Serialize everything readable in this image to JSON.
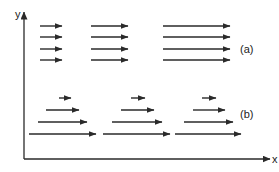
{
  "colors": {
    "stroke": "#2a2a2a",
    "background": "#ffffff",
    "text": "#222222"
  },
  "axes": {
    "x_label": "x",
    "y_label": "y",
    "origin": [
      24,
      159
    ],
    "x_end": 270,
    "y_end": 12
  },
  "groups": {
    "a": {
      "label": "(a)",
      "label_pos": [
        240,
        53
      ],
      "description": "uniform flow: equal-length arrows in every row",
      "arrows": [
        [
          40,
          62,
          26
        ],
        [
          91,
          128,
          26
        ],
        [
          163,
          230,
          26
        ],
        [
          40,
          62,
          37
        ],
        [
          91,
          128,
          37
        ],
        [
          163,
          230,
          37
        ],
        [
          40,
          62,
          49
        ],
        [
          91,
          128,
          49
        ],
        [
          163,
          230,
          49
        ],
        [
          40,
          62,
          60
        ],
        [
          91,
          128,
          60
        ],
        [
          163,
          230,
          60
        ]
      ]
    },
    "b": {
      "label": "(b)",
      "label_pos": [
        240,
        118
      ],
      "description": "shear flow: arrow length increases downward",
      "arrows": [
        [
          59,
          71,
          98
        ],
        [
          131,
          145,
          98
        ],
        [
          202,
          216,
          98
        ],
        [
          46,
          79,
          110
        ],
        [
          121,
          154,
          110
        ],
        [
          193,
          225,
          110
        ],
        [
          38,
          87,
          122
        ],
        [
          112,
          162,
          122
        ],
        [
          184,
          233,
          122
        ],
        [
          29,
          96,
          134
        ],
        [
          103,
          170,
          134
        ],
        [
          175,
          241,
          134
        ]
      ]
    }
  }
}
